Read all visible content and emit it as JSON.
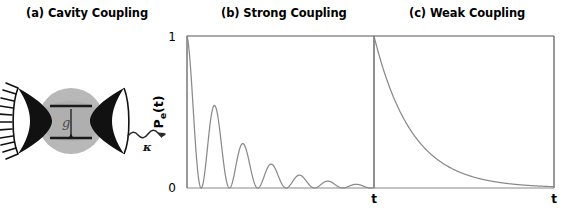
{
  "figure": {
    "panels": [
      {
        "id": "a",
        "title": "(a) Cavity Coupling"
      },
      {
        "id": "b",
        "title": "(b) Strong Coupling"
      },
      {
        "id": "c",
        "title": "(c) Weak Coupling"
      }
    ]
  },
  "cavity": {
    "mirror_left_name": "left cavity mirror",
    "mirror_right_name": "right cavity mirror",
    "mode_volume_name": "cavity mode volume",
    "atom_label": "g",
    "decay_label": "κ",
    "upper_level_name": "excited state level",
    "lower_level_name": "ground state level",
    "colors": {
      "mirror": "#111111",
      "sphere": "#b8b8b8",
      "sphere_inner": "#9a9a9a",
      "line": "#222222"
    }
  },
  "axes": {
    "ylabel_main": "P",
    "ylabel_sub": "e",
    "ylabel_tail": "(t)",
    "ytick_top": "1",
    "ytick_bottom": "0",
    "xlabel_b": "t",
    "xlabel_c": "t"
  },
  "chart_data": [
    {
      "type": "line",
      "panel": "b",
      "title": "(b) Strong Coupling",
      "xlabel": "t",
      "ylabel": "Pe(t)",
      "ylim": [
        0,
        1
      ],
      "xlim": [
        0,
        6.6
      ],
      "grid": false,
      "legend": null,
      "description": "Damped vacuum Rabi oscillations: excited-state population oscillates between 1 and 0 with a decaying envelope.",
      "model": "exp(-gamma*t) * cos(pi*t)^2",
      "gamma": 0.62,
      "rabi_period": 1.0,
      "n_peaks": 7,
      "peak_times": [
        0.0,
        1.0,
        2.0,
        3.0,
        4.0,
        5.0,
        6.0
      ],
      "peak_values": [
        1.0,
        0.54,
        0.33,
        0.2,
        0.12,
        0.07,
        0.04
      ],
      "minimum_value": 0.0,
      "x": [
        0,
        0.25,
        0.5,
        0.75,
        1,
        1.25,
        1.5,
        1.75,
        2,
        2.25,
        2.5,
        2.75,
        3,
        3.25,
        3.5,
        3.75,
        4,
        4.25,
        4.5,
        4.75,
        5,
        5.25,
        5.5,
        5.75,
        6,
        6.25,
        6.5
      ],
      "y": [
        1.0,
        0.43,
        0.0,
        0.29,
        0.54,
        0.23,
        0.0,
        0.16,
        0.33,
        0.14,
        0.0,
        0.09,
        0.2,
        0.09,
        0.0,
        0.05,
        0.12,
        0.05,
        0.0,
        0.03,
        0.07,
        0.03,
        0.0,
        0.02,
        0.04,
        0.02,
        0.0
      ]
    },
    {
      "type": "line",
      "panel": "c",
      "title": "(c) Weak Coupling",
      "xlabel": "t",
      "ylabel": "Pe(t)",
      "ylim": [
        0,
        1
      ],
      "xlim": [
        0,
        6.6
      ],
      "grid": false,
      "legend": null,
      "description": "Irreversible spontaneous emission: excited-state population decays exponentially with no oscillation.",
      "model": "exp(-gamma*t)",
      "gamma": 0.72,
      "x": [
        0,
        0.5,
        1,
        1.5,
        2,
        2.5,
        3,
        3.5,
        4,
        4.5,
        5,
        5.5,
        6,
        6.5
      ],
      "y": [
        1.0,
        0.7,
        0.49,
        0.34,
        0.24,
        0.17,
        0.115,
        0.081,
        0.056,
        0.039,
        0.027,
        0.019,
        0.013,
        0.009
      ]
    }
  ]
}
